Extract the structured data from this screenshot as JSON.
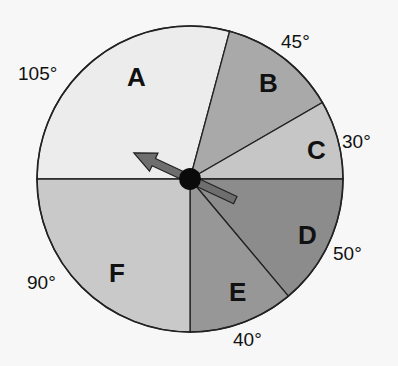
{
  "spinner": {
    "center": [
      190,
      179
    ],
    "radius": 153,
    "pointer_angle_deg": 155,
    "sectors": [
      {
        "label": "A",
        "degrees": 105,
        "start": 75,
        "end": 180,
        "color": "#ececec",
        "label_pos": [
          127,
          86
        ],
        "deg_label": "105°",
        "deg_pos": [
          18,
          80
        ]
      },
      {
        "label": "B",
        "degrees": 45,
        "start": 30,
        "end": 75,
        "color": "#a9a9a9",
        "label_pos": [
          259,
          92
        ],
        "deg_label": "45°",
        "deg_pos": [
          281,
          48
        ]
      },
      {
        "label": "C",
        "degrees": 30,
        "start": 0,
        "end": 30,
        "color": "#c6c6c6",
        "label_pos": [
          307,
          159
        ],
        "deg_label": "30°",
        "deg_pos": [
          342,
          148
        ]
      },
      {
        "label": "D",
        "degrees": 50,
        "start": -50,
        "end": 0,
        "color": "#8c8c8c",
        "label_pos": [
          298,
          244
        ],
        "deg_label": "50°",
        "deg_pos": [
          333,
          260
        ]
      },
      {
        "label": "E",
        "degrees": 40,
        "start": -90,
        "end": -50,
        "color": "#979797",
        "label_pos": [
          229,
          301
        ],
        "deg_label": "40°",
        "deg_pos": [
          233,
          346
        ]
      },
      {
        "label": "F",
        "degrees": 90,
        "start": -180,
        "end": -90,
        "color": "#c9c9c9",
        "label_pos": [
          109,
          282
        ],
        "deg_label": "90°",
        "deg_pos": [
          27,
          289
        ]
      }
    ]
  }
}
